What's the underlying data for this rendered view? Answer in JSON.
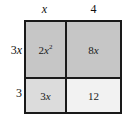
{
  "diagram": {
    "type": "area-model",
    "title": "",
    "columns": [
      {
        "label": "x",
        "width_term": "x"
      },
      {
        "label": "4",
        "width_term": "4"
      }
    ],
    "rows": [
      {
        "label": "2x",
        "height_term": "2x"
      },
      {
        "label": "3",
        "height_term": "3"
      }
    ],
    "cells": [
      {
        "row": 0,
        "col": 0,
        "coefficient": "2",
        "variable": "x",
        "exponent": "2",
        "text": "2x2",
        "shade": "dark",
        "fill": "#c6c6c6"
      },
      {
        "row": 0,
        "col": 1,
        "coefficient": "8",
        "variable": "x",
        "exponent": "",
        "text": "8x",
        "shade": "dark",
        "fill": "#c6c6c6"
      },
      {
        "row": 1,
        "col": 0,
        "coefficient": "3",
        "variable": "x",
        "exponent": "",
        "text": "3x",
        "shade": "mid",
        "fill": "#dcdcdc"
      },
      {
        "row": 1,
        "col": 1,
        "coefficient": "12",
        "variable": "",
        "exponent": "",
        "text": "12",
        "shade": "light",
        "fill": "#f2f2f2"
      }
    ],
    "colors": {
      "border": "#1a1a1a",
      "text": "#1a1a1a",
      "background": "#ffffff"
    }
  }
}
